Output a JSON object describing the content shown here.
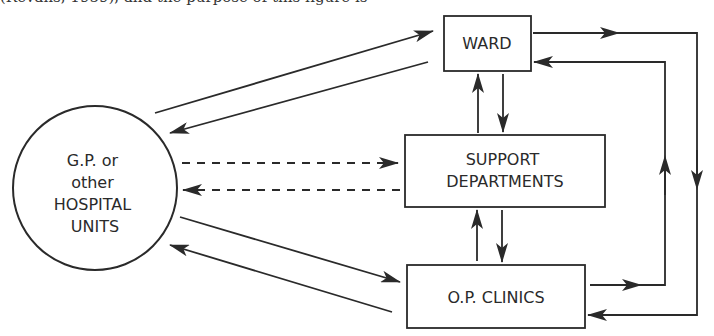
{
  "header": {
    "cutoff_text": "(Revans, 1959), and the purpose of this figure is"
  },
  "diagram": {
    "type": "flow",
    "nodes": {
      "gp": {
        "lines": [
          "G.P. or",
          "other",
          "HOSPITAL",
          "UNITS"
        ],
        "shape": "circle"
      },
      "ward": {
        "lines": [
          "WARD"
        ],
        "shape": "rect"
      },
      "support": {
        "lines": [
          "SUPPORT",
          "DEPARTMENTS"
        ],
        "shape": "rect"
      },
      "opclinics": {
        "lines": [
          "O.P. CLINICS"
        ],
        "shape": "rect"
      }
    },
    "edges": [
      {
        "from": "gp",
        "to": "ward",
        "style": "solid"
      },
      {
        "from": "ward",
        "to": "gp",
        "style": "solid"
      },
      {
        "from": "gp",
        "to": "support",
        "style": "dashed"
      },
      {
        "from": "support",
        "to": "gp",
        "style": "dashed"
      },
      {
        "from": "gp",
        "to": "opclinics",
        "style": "solid"
      },
      {
        "from": "opclinics",
        "to": "gp",
        "style": "solid"
      },
      {
        "from": "support",
        "to": "ward",
        "style": "solid"
      },
      {
        "from": "ward",
        "to": "support",
        "style": "solid"
      },
      {
        "from": "opclinics",
        "to": "support",
        "style": "solid"
      },
      {
        "from": "support",
        "to": "opclinics",
        "style": "solid"
      },
      {
        "from": "ward",
        "to": "opclinics",
        "style": "solid",
        "route": "outer-right-loop"
      },
      {
        "from": "opclinics",
        "to": "ward",
        "style": "solid",
        "route": "inner-right-loop"
      }
    ],
    "colors": {
      "line": "#2a2a2a",
      "background": "#ffffff"
    }
  }
}
